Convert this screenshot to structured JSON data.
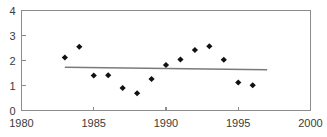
{
  "chart_data": {
    "type": "scatter",
    "title": "",
    "subtitle": "",
    "xlabel": "",
    "ylabel": "",
    "xlim": [
      1980,
      2000
    ],
    "ylim": [
      0,
      4
    ],
    "grid": false,
    "legend": null,
    "xticks": [
      1980,
      1985,
      1990,
      1995,
      2000
    ],
    "xticklabels": [
      "1980",
      "1985",
      "1990",
      "1995",
      "2000"
    ],
    "yticks": [
      0,
      1,
      2,
      3,
      4
    ],
    "yticklabels": [
      "0",
      "1",
      "2",
      "3",
      "4"
    ],
    "series": [
      {
        "name": "observations",
        "marker": "diamond",
        "color": "#111111",
        "x": [
          1983,
          1984,
          1985,
          1986,
          1987,
          1988,
          1989,
          1990,
          1991,
          1992,
          1993,
          1994,
          1995,
          1996
        ],
        "y": [
          2.12,
          2.55,
          1.4,
          1.41,
          0.9,
          0.69,
          1.26,
          1.82,
          2.04,
          2.42,
          2.57,
          2.03,
          1.12,
          1.01
        ]
      },
      {
        "name": "trend",
        "marker": "none",
        "color": "#7a7a7a",
        "x": [
          1983,
          1997
        ],
        "y": [
          1.73,
          1.63
        ]
      }
    ],
    "annotations": []
  },
  "axes": {
    "left_spine": true,
    "top_spine": true,
    "right_spine": true,
    "bottom_spine": true
  }
}
